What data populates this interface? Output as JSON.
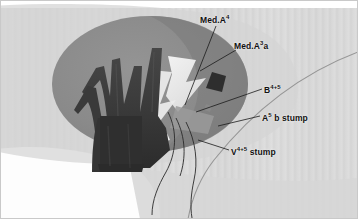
{
  "figure": {
    "width": 358,
    "height": 219,
    "style": "grayscale anatomical drawing",
    "background_color": "#ffffff",
    "canvas_color": "#d9d9d9",
    "parenchyma_color": "#8c8c8c",
    "vessel_color": "#3a3a3a",
    "cut_surface_color": "#f2f2f2",
    "stump_color": "#2e2e2e",
    "leader_line_color": "#1a1a1a"
  },
  "labels": [
    {
      "id": "med-a4",
      "text_base": "Med.A",
      "sup": "4",
      "suffix": "",
      "full": "Med.A4",
      "x": 200,
      "y": 14,
      "leader": "M 216 26 L 185 105"
    },
    {
      "id": "med-a3a",
      "text_base": "Med.A",
      "sup": "3",
      "suffix": "a",
      "full": "Med.A3a",
      "x": 234,
      "y": 40,
      "leader": "M 236 50 L 200 71"
    },
    {
      "id": "b45",
      "text_base": "B",
      "sup": "4+5",
      "suffix": "",
      "full": "B4+5",
      "x": 264,
      "y": 84,
      "leader": "M 262 89 L 196 112"
    },
    {
      "id": "a5b-stump",
      "text_base": "A",
      "sup": "5",
      "suffix": " b stump",
      "full": "A5 b stump",
      "x": 262,
      "y": 112,
      "leader": "M 260 116 L 218 126"
    },
    {
      "id": "v45-stump",
      "text_base": "V",
      "sup": "4+5",
      "suffix": " stump",
      "full": "V4+5 stump",
      "x": 231,
      "y": 146,
      "leader": "M 229 150 L 198 140"
    }
  ],
  "structures": [
    {
      "name": "lung-parenchyma-ellipse",
      "description": "large mid-gray ellipse representing the lung lobe"
    },
    {
      "name": "bronchovascular-tree",
      "description": "dark branching bronchial and vascular trunks"
    },
    {
      "name": "intersegmental-plane",
      "description": "pale cut surface wedges"
    },
    {
      "name": "bronchial-stump",
      "description": "small dark diamond stump"
    },
    {
      "name": "suture-threads",
      "description": "thin dark curved threads at lower margin"
    },
    {
      "name": "background-striation",
      "description": "subtle vertical gray striations"
    }
  ]
}
